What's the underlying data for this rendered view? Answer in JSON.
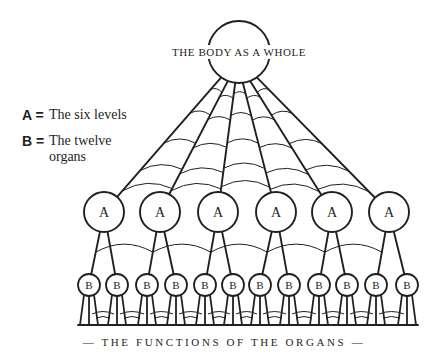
{
  "diagram": {
    "top_node": {
      "label": "THE BODY AS A WHOLE",
      "cx": 239,
      "cy": 52,
      "r": 31
    },
    "level_a": {
      "label": "A",
      "count": 6,
      "cy": 212,
      "r": 20,
      "cx": [
        104,
        160,
        218,
        276,
        332,
        389
      ]
    },
    "level_b": {
      "label": "B",
      "count": 12,
      "cy": 285,
      "r": 11,
      "cx": [
        89,
        117,
        147,
        176,
        205,
        233,
        260,
        289,
        319,
        347,
        376,
        407
      ]
    },
    "baseline": {
      "y": 325,
      "x1": 78,
      "x2": 418
    },
    "footer_label": "— THE FUNCTIONS OF THE ORGANS —",
    "stroke_color": "#231f20"
  },
  "legend": {
    "items": [
      {
        "key": "A =",
        "text": "The six levels"
      },
      {
        "key": "B =",
        "text": "The twelve organs"
      }
    ]
  }
}
